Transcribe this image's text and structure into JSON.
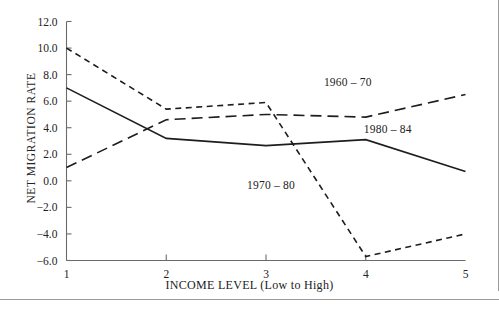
{
  "chart_data": {
    "type": "line",
    "title": "",
    "xlabel": "INCOME LEVEL (Low to High)",
    "ylabel": "NET MIGRATION RATE",
    "x": [
      1,
      2,
      3,
      4,
      5
    ],
    "xtick_labels": [
      "1",
      "2",
      "3",
      "4",
      "5"
    ],
    "ytick_labels": [
      "12.0",
      "10.0",
      "8.0",
      "6.0",
      "4.0",
      "2.0",
      "0.0",
      "-2.0",
      "-4.0",
      "-6.0"
    ],
    "ytick_values": [
      12.0,
      10.0,
      8.0,
      6.0,
      4.0,
      2.0,
      0.0,
      -2.0,
      -4.0,
      -6.0
    ],
    "xlim": [
      1,
      5
    ],
    "ylim": [
      -6.0,
      12.0
    ],
    "grid": false,
    "legend_position": "inline-annotations",
    "series": [
      {
        "name": "1970 - 80",
        "style": "short-dashed",
        "color": "#1d1d1d",
        "values": [
          10.0,
          5.4,
          5.9,
          -5.7,
          -4.0
        ],
        "label_x": 3.05,
        "label_y": -0.6
      },
      {
        "name": "1960 - 70",
        "style": "long-dashed",
        "color": "#1d1d1d",
        "values": [
          1.0,
          4.6,
          5.0,
          4.8,
          6.5
        ],
        "label_x": 3.82,
        "label_y": 7.15
      },
      {
        "name": "1980 - 84",
        "style": "solid",
        "color": "#1d1d1d",
        "values": [
          7.0,
          3.2,
          2.65,
          3.1,
          0.7
        ],
        "label_x": 4.22,
        "label_y": 3.6
      }
    ]
  },
  "axes": {
    "y_title": "NET MIGRATION RATE",
    "x_title": "INCOME LEVEL (Low to High)"
  }
}
